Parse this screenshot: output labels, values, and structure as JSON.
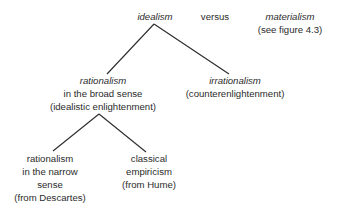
{
  "diagram": {
    "type": "tree",
    "colors": {
      "text": "#2b2b2b",
      "lines": "#2b2b2b",
      "background": "#ffffff"
    },
    "top": {
      "idealism": "idealism",
      "versus": "versus",
      "materialism": "materialism",
      "materialism_note": "(see figure 4.3)"
    },
    "level2": {
      "rationalism_broad": {
        "title": "rationalism",
        "line2": "in the broad sense",
        "line3": "(idealistic enlightenment)"
      },
      "irrationalism": {
        "title": "irrationalism",
        "line2": "(counterenlightenment)"
      }
    },
    "level3": {
      "rationalism_narrow": {
        "line1": "rationalism",
        "line2": "in the narrow",
        "line3": "sense",
        "line4": "(from Descartes)"
      },
      "classical_empiricism": {
        "line1": "classical",
        "line2": "empiricism",
        "line3": "(from Hume)"
      }
    },
    "edges": [
      [
        "idealism",
        "rationalism in the broad sense"
      ],
      [
        "idealism",
        "irrationalism"
      ],
      [
        "rationalism in the broad sense",
        "rationalism in the narrow sense"
      ],
      [
        "rationalism in the broad sense",
        "classical empiricism"
      ]
    ]
  }
}
